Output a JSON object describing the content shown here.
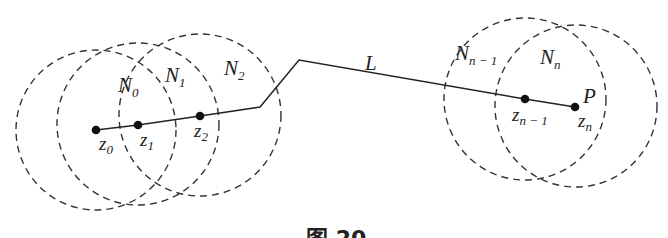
{
  "diagram": {
    "path_label": "L",
    "end_label": "P",
    "caption": "图 20",
    "neighborhoods": [
      {
        "name": "N",
        "sub": "0"
      },
      {
        "name": "N",
        "sub": "1"
      },
      {
        "name": "N",
        "sub": "2"
      },
      {
        "name": "N",
        "sub": "n − 1"
      },
      {
        "name": "N",
        "sub": "n"
      }
    ],
    "points": [
      {
        "name": "z",
        "sub": "0"
      },
      {
        "name": "z",
        "sub": "1"
      },
      {
        "name": "z",
        "sub": "2"
      },
      {
        "name": "z",
        "sub": "n − 1"
      },
      {
        "name": "z",
        "sub": "n"
      }
    ]
  }
}
